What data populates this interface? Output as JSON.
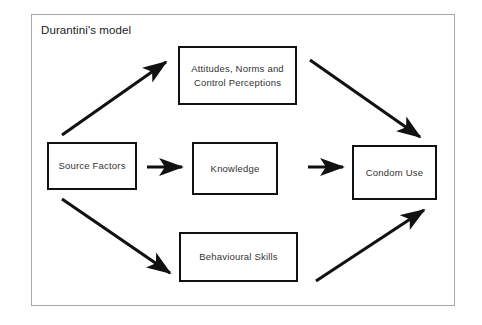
{
  "figure": {
    "title": "Durantini's model",
    "frame_border_color": "#a9a9a9",
    "box_border_color": "#111111",
    "text_color": "#333333",
    "background": "#ffffff"
  },
  "nodes": [
    {
      "id": "source-factors",
      "label": "Source Factors",
      "position": "left-middle"
    },
    {
      "id": "attitudes-norms-control-perceptions",
      "label": "Attitudes, Norms and\nControl Perceptions",
      "position": "top-center"
    },
    {
      "id": "knowledge",
      "label": "Knowledge",
      "position": "center"
    },
    {
      "id": "behavioural-skills",
      "label": "Behavioural Skills",
      "position": "bottom-center"
    },
    {
      "id": "condom-use",
      "label": "Condom Use",
      "position": "right-middle"
    }
  ],
  "edges": [
    {
      "id": "source-to-attitudes",
      "from": "source-factors",
      "to": "attitudes-norms-control-perceptions",
      "style": "diagonal-up-right",
      "arrowhead": "end"
    },
    {
      "id": "source-to-knowledge",
      "from": "source-factors",
      "to": "knowledge",
      "style": "horizontal-short",
      "arrowhead": "end"
    },
    {
      "id": "source-to-behavioural",
      "from": "source-factors",
      "to": "behavioural-skills",
      "style": "diagonal-down-right",
      "arrowhead": "end"
    },
    {
      "id": "attitudes-to-condom",
      "from": "attitudes-norms-control-perceptions",
      "to": "condom-use",
      "style": "diagonal-down-right",
      "arrowhead": "end"
    },
    {
      "id": "knowledge-to-condom",
      "from": "knowledge",
      "to": "condom-use",
      "style": "horizontal-short",
      "arrowhead": "end"
    },
    {
      "id": "behavioural-to-condom",
      "from": "behavioural-skills",
      "to": "condom-use",
      "style": "diagonal-up-right",
      "arrowhead": "end"
    }
  ]
}
